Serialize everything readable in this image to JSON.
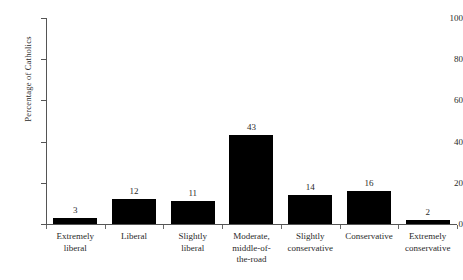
{
  "chart_data": {
    "type": "bar",
    "title": "",
    "subtitle": "",
    "xlabel": "",
    "ylabel": "Percentage of Catholics",
    "ylim": [
      0,
      100
    ],
    "yticks": [
      0,
      20,
      40,
      60,
      80,
      100
    ],
    "grid": false,
    "legend": null,
    "bar_color": "#000000",
    "axis_color": "#555555",
    "show_value_labels": true,
    "categories": [
      "Extremely liberal",
      "Liberal",
      "Slightly liberal",
      "Moderate, middle-of-the-road",
      "Slightly conservative",
      "Conservative",
      "Extremely conservative"
    ],
    "category_lines": [
      [
        "Extremely",
        "liberal"
      ],
      [
        "Liberal"
      ],
      [
        "Slightly",
        "liberal"
      ],
      [
        "Moderate,",
        "middle-of-",
        "the-road"
      ],
      [
        "Slightly",
        "conservative"
      ],
      [
        "Conservative"
      ],
      [
        "Extremely",
        "conservative"
      ]
    ],
    "values": [
      3,
      12,
      11,
      43,
      14,
      16,
      2
    ],
    "value_labels": [
      "3",
      "12",
      "11",
      "43",
      "14",
      "16",
      "2"
    ],
    "bar_pixel_heights": [
      8,
      28,
      26,
      92,
      32,
      37,
      6
    ]
  },
  "axis": {
    "y_tick_labels": [
      "0",
      "20",
      "40",
      "60",
      "80",
      "100"
    ]
  }
}
